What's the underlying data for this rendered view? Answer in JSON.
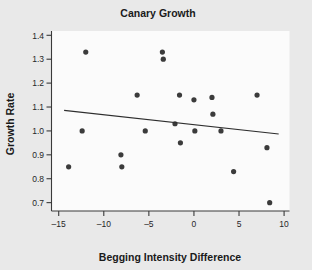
{
  "chart_data": {
    "type": "scatter",
    "title": "Canary Growth",
    "xlabel": "Begging Intensity Difference",
    "ylabel": "Growth Rate",
    "xlim": [
      -15.8,
      10.6
    ],
    "ylim": [
      0.665,
      1.418
    ],
    "xticks": [
      -15,
      -10,
      -5,
      0,
      5,
      10
    ],
    "xtick_labels": [
      "–15",
      "–10",
      "–5",
      "0",
      "5",
      "10"
    ],
    "yticks": [
      0.7,
      0.8,
      0.9,
      1.0,
      1.1,
      1.2,
      1.3,
      1.4
    ],
    "ytick_labels": [
      "0.7",
      "0.8",
      "0.9",
      "1.0",
      "1.1",
      "1.2",
      "1.3",
      "1.4"
    ],
    "grid": false,
    "legend": false,
    "marker": "circle",
    "marker_color": "#3b3b3b",
    "points": [
      {
        "x": -13.9,
        "y": 0.85
      },
      {
        "x": -12.4,
        "y": 1.0
      },
      {
        "x": -12.0,
        "y": 1.33
      },
      {
        "x": -8.1,
        "y": 0.9
      },
      {
        "x": -8.0,
        "y": 0.85
      },
      {
        "x": -6.3,
        "y": 1.15
      },
      {
        "x": -5.4,
        "y": 1.0
      },
      {
        "x": -3.5,
        "y": 1.33
      },
      {
        "x": -3.4,
        "y": 1.3
      },
      {
        "x": -2.1,
        "y": 1.03
      },
      {
        "x": -1.6,
        "y": 1.15
      },
      {
        "x": -1.5,
        "y": 0.95
      },
      {
        "x": 0.0,
        "y": 1.13
      },
      {
        "x": 0.1,
        "y": 1.0
      },
      {
        "x": 2.0,
        "y": 1.14
      },
      {
        "x": 2.1,
        "y": 1.07
      },
      {
        "x": 3.0,
        "y": 1.0
      },
      {
        "x": 4.4,
        "y": 0.83
      },
      {
        "x": 7.0,
        "y": 1.15
      },
      {
        "x": 8.1,
        "y": 0.93
      },
      {
        "x": 8.4,
        "y": 0.7
      }
    ],
    "trend_line": {
      "label": "least-squares fit",
      "x_start": -14.4,
      "y_start": 1.086,
      "x_end": 9.4,
      "y_end": 0.987,
      "color": "#2e2e2e"
    }
  }
}
